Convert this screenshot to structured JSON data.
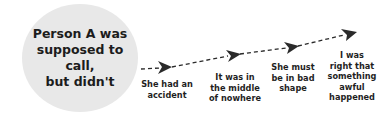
{
  "diagram": {
    "start_node": {
      "text": "Person A was\nsupposed to call,\nbut didn't",
      "fill": "#e8e8e8"
    },
    "steps": [
      {
        "text": "She had an\naccident"
      },
      {
        "text": "It was in\nthe middle\nof nowhere"
      },
      {
        "text": "She must\nbe in bad\nshape"
      },
      {
        "text": "I was\nright that\nsomething\nawful\nhappened"
      }
    ],
    "arrow_color": "#2a2a2a"
  }
}
